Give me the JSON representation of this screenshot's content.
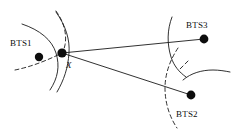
{
  "figure": {
    "name": "bts-triangulation-diagram",
    "background_color": "#ffffff",
    "stroke_color": "#1a1a1a",
    "width": 233,
    "height": 140
  },
  "labels": {
    "bts1": "BTS1",
    "bts2": "BTS2",
    "bts3": "BTS3",
    "target": "X"
  },
  "nodes": [
    {
      "id": "bts1",
      "label": "BTS1",
      "x": 39,
      "y": 57,
      "radius": 4.2
    },
    {
      "id": "target",
      "label": "X",
      "x": 62,
      "y": 53,
      "radius": 4.6
    },
    {
      "id": "bts3",
      "label": "BTS3",
      "x": 204,
      "y": 39,
      "radius": 4.4
    },
    {
      "id": "bts2",
      "label": "BTS2",
      "x": 191,
      "y": 95,
      "radius": 4.4
    }
  ],
  "edges": [
    {
      "id": "edge-x-bts3",
      "from": "target",
      "to": "bts3",
      "style": "solid"
    },
    {
      "id": "edge-x-bts2",
      "from": "target",
      "to": "bts2",
      "style": "solid"
    }
  ],
  "arcs": [
    {
      "id": "arc-bts1-solid-outer",
      "style": "solid",
      "d": "M 22 24 C 40 30 52 40 56 53 C 60 66 58 78 50 90"
    },
    {
      "id": "arc-bts1-solid-inner",
      "style": "solid",
      "d": "M 56 12 C 66 26 70 40 69 53 C 68 68 64 80 57 92"
    },
    {
      "id": "arc-bts1-dashed-top",
      "style": "dashed",
      "d": "M 56 11 C 64 22 67 34 65 45 C 64 50 63 51 62 53"
    },
    {
      "id": "arc-bts1-dashed-low",
      "style": "dashed",
      "d": "M 15 70 C 30 67 46 61 62 53"
    },
    {
      "id": "arc-bts3-solid-left",
      "style": "solid",
      "d": "M 172 17 C 167 30 167 44 171 57 C 174 66 179 72 186 77"
    },
    {
      "id": "arc-bts3-solid-right",
      "style": "solid",
      "d": "M 183 80 C 191 73 202 70 213 70 C 219 70 225 71 230 72"
    },
    {
      "id": "arc-bts3-dashed-tick",
      "style": "dashed",
      "d": "M 188 61 C 185 64 182 67 179 70"
    },
    {
      "id": "arc-bts2-dashed",
      "style": "dashed",
      "d": "M 178 48 C 170 60 165 74 165 88 C 165 102 169 116 177 128"
    }
  ],
  "style_values": {
    "line_width": "0.9",
    "dash_pattern": "4,3",
    "dot_fill": "#0d0d0d"
  }
}
